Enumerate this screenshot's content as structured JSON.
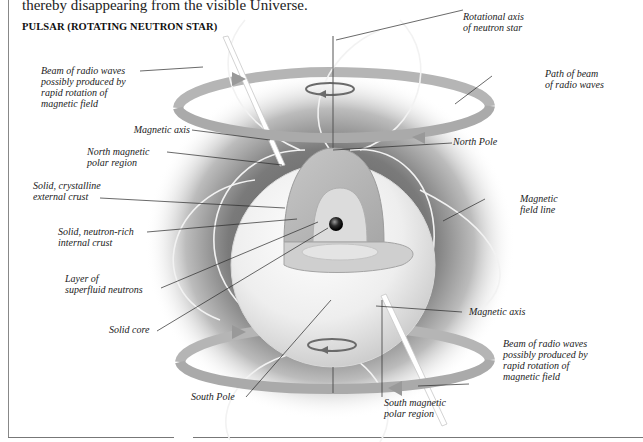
{
  "intro_text": "thereby disappearing from the visible Universe.",
  "title": "PULSAR (ROTATING NEUTRON STAR)",
  "labels": {
    "rotational_axis": "Rotational axis\nof neutron star",
    "beam_top": "Beam of radio waves\npossibly produced by\nrapid rotation of\nmagnetic field",
    "path_of_beam": "Path of beam\nof radio waves",
    "magnetic_axis_top": "Magnetic axis",
    "north_pole": "North Pole",
    "north_magnetic_polar_region": "North magnetic\npolar region",
    "external_crust": "Solid, crystalline\nexternal crust",
    "magnetic_field_line": "Magnetic\nfield line",
    "internal_crust": "Solid, neutron-rich\ninternal crust",
    "superfluid_layer": "Layer of\nsuperfluid neutrons",
    "solid_core": "Solid core",
    "magnetic_axis_bottom": "Magnetic axis",
    "beam_bottom": "Beam of radio waves\npossibly produced by\nrapid rotation of\nmagnetic field",
    "south_pole": "South Pole",
    "south_magnetic_polar_region": "South magnetic\npolar region"
  },
  "colors": {
    "background": "#ffffff",
    "beam_band": "#b3b3b3",
    "glow": "#6e6e6e",
    "sphere": "#ececec",
    "crust": "#bdbdbd",
    "core": "#1c1c1c",
    "leader_line": "#2a2a2a"
  }
}
